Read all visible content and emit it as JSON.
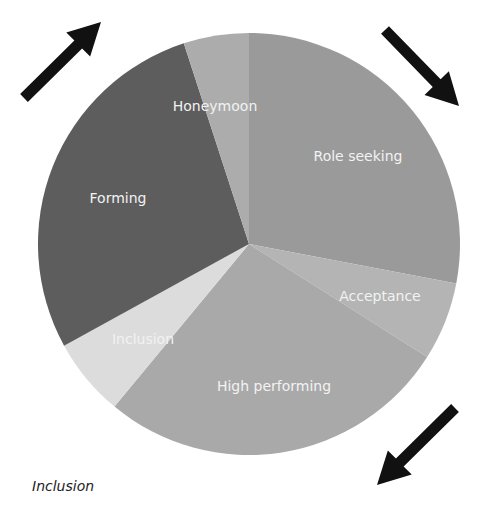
{
  "chart_data": {
    "type": "pie",
    "title": "",
    "caption": "Inclusion",
    "start_angle_deg": 0,
    "direction": "clockwise",
    "slices": [
      {
        "label": "Role seeking",
        "value": 28,
        "color": "#9a9a9a",
        "label_pos": [
          358,
          156
        ]
      },
      {
        "label": "Acceptance",
        "value": 6,
        "color": "#b4b4b4",
        "label_pos": [
          380,
          296
        ]
      },
      {
        "label": "High performing",
        "value": 27,
        "color": "#a9a9a9",
        "label_pos": [
          274,
          386
        ]
      },
      {
        "label": "Inclusion",
        "value": 6,
        "color": "#dcdcdc",
        "label_pos": [
          143,
          339
        ]
      },
      {
        "label": "Forming",
        "value": 28,
        "color": "#5d5d5d",
        "label_pos": [
          118,
          198
        ]
      },
      {
        "label": "Honeymoon",
        "value": 5,
        "color": "#acacac",
        "label_pos": [
          215,
          106
        ]
      }
    ],
    "center": [
      249,
      244
    ],
    "radius": 211,
    "arrows": [
      {
        "name": "arrow-up-right",
        "from": [
          24,
          98
        ],
        "to": [
          101,
          22
        ]
      },
      {
        "name": "arrow-down-right",
        "from": [
          385,
          30
        ],
        "to": [
          459,
          106
        ]
      },
      {
        "name": "arrow-down-left",
        "from": [
          455,
          408
        ],
        "to": [
          377,
          485
        ]
      }
    ]
  }
}
